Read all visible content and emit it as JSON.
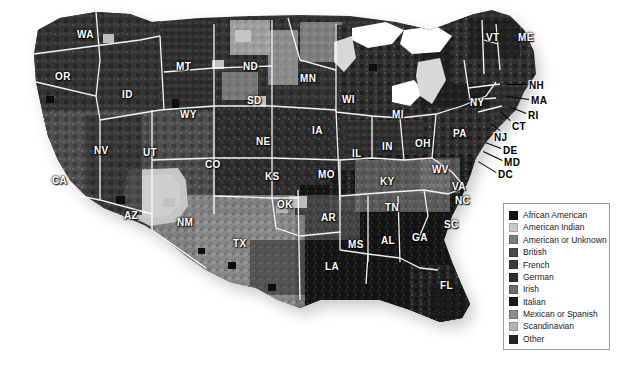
{
  "map": {
    "title": "Predominant Ancestry by County, Continental United States",
    "background_color": "#ffffff",
    "border_color": "#ffffff",
    "shadow_color": "#9a9a9a",
    "state_labels": [
      {
        "abbr": "WA",
        "x": 77,
        "y": 30,
        "outside": false
      },
      {
        "abbr": "OR",
        "x": 55,
        "y": 72,
        "outside": false
      },
      {
        "abbr": "ID",
        "x": 122,
        "y": 90,
        "outside": false
      },
      {
        "abbr": "MT",
        "x": 176,
        "y": 62,
        "outside": false
      },
      {
        "abbr": "WY",
        "x": 180,
        "y": 110,
        "outside": false
      },
      {
        "abbr": "ND",
        "x": 243,
        "y": 62,
        "outside": false
      },
      {
        "abbr": "SD",
        "x": 247,
        "y": 96,
        "outside": false
      },
      {
        "abbr": "MN",
        "x": 300,
        "y": 74,
        "outside": false
      },
      {
        "abbr": "WI",
        "x": 342,
        "y": 95,
        "outside": false
      },
      {
        "abbr": "MI",
        "x": 392,
        "y": 110,
        "outside": false
      },
      {
        "abbr": "NE",
        "x": 256,
        "y": 137,
        "outside": false
      },
      {
        "abbr": "IA",
        "x": 312,
        "y": 126,
        "outside": false
      },
      {
        "abbr": "IL",
        "x": 352,
        "y": 149,
        "outside": false
      },
      {
        "abbr": "IN",
        "x": 382,
        "y": 142,
        "outside": false
      },
      {
        "abbr": "OH",
        "x": 415,
        "y": 139,
        "outside": false
      },
      {
        "abbr": "PA",
        "x": 453,
        "y": 129,
        "outside": false
      },
      {
        "abbr": "NY",
        "x": 470,
        "y": 98,
        "outside": false
      },
      {
        "abbr": "VT",
        "x": 486,
        "y": 33,
        "outside": false
      },
      {
        "abbr": "ME",
        "x": 518,
        "y": 33,
        "outside": false
      },
      {
        "abbr": "NV",
        "x": 94,
        "y": 146,
        "outside": false
      },
      {
        "abbr": "UT",
        "x": 143,
        "y": 148,
        "outside": false
      },
      {
        "abbr": "CO",
        "x": 205,
        "y": 160,
        "outside": false
      },
      {
        "abbr": "KS",
        "x": 265,
        "y": 172,
        "outside": false
      },
      {
        "abbr": "MO",
        "x": 318,
        "y": 170,
        "outside": false
      },
      {
        "abbr": "KY",
        "x": 380,
        "y": 177,
        "outside": false
      },
      {
        "abbr": "WV",
        "x": 432,
        "y": 165,
        "outside": false
      },
      {
        "abbr": "VA",
        "x": 452,
        "y": 182,
        "outside": false
      },
      {
        "abbr": "CA",
        "x": 52,
        "y": 176,
        "outside": false
      },
      {
        "abbr": "AZ",
        "x": 124,
        "y": 211,
        "outside": false
      },
      {
        "abbr": "NM",
        "x": 177,
        "y": 218,
        "outside": false
      },
      {
        "abbr": "OK",
        "x": 277,
        "y": 200,
        "outside": false
      },
      {
        "abbr": "AR",
        "x": 321,
        "y": 213,
        "outside": false
      },
      {
        "abbr": "TN",
        "x": 385,
        "y": 203,
        "outside": false
      },
      {
        "abbr": "NC",
        "x": 455,
        "y": 196,
        "outside": false
      },
      {
        "abbr": "SC",
        "x": 444,
        "y": 220,
        "outside": false
      },
      {
        "abbr": "GA",
        "x": 412,
        "y": 233,
        "outside": false
      },
      {
        "abbr": "AL",
        "x": 381,
        "y": 236,
        "outside": false
      },
      {
        "abbr": "MS",
        "x": 348,
        "y": 240,
        "outside": false
      },
      {
        "abbr": "LA",
        "x": 325,
        "y": 262,
        "outside": false
      },
      {
        "abbr": "TX",
        "x": 233,
        "y": 239,
        "outside": false
      },
      {
        "abbr": "FL",
        "x": 440,
        "y": 281,
        "outside": false
      },
      {
        "abbr": "NH",
        "x": 529,
        "y": 81,
        "outside": true
      },
      {
        "abbr": "MA",
        "x": 531,
        "y": 96,
        "outside": true
      },
      {
        "abbr": "RI",
        "x": 528,
        "y": 111,
        "outside": true
      },
      {
        "abbr": "CT",
        "x": 512,
        "y": 122,
        "outside": true
      },
      {
        "abbr": "NJ",
        "x": 494,
        "y": 133,
        "outside": true
      },
      {
        "abbr": "DE",
        "x": 503,
        "y": 146,
        "outside": true
      },
      {
        "abbr": "MD",
        "x": 504,
        "y": 158,
        "outside": true
      },
      {
        "abbr": "DC",
        "x": 498,
        "y": 170,
        "outside": true
      }
    ],
    "leader_lines": [
      {
        "x1": 527,
        "y1": 85,
        "x2": 506,
        "y2": 85
      },
      {
        "x1": 529,
        "y1": 100,
        "x2": 506,
        "y2": 97
      },
      {
        "x1": 526,
        "y1": 114,
        "x2": 509,
        "y2": 107
      },
      {
        "x1": 510,
        "y1": 121,
        "x2": 500,
        "y2": 112
      },
      {
        "x1": 500,
        "y1": 131,
        "x2": 490,
        "y2": 124
      },
      {
        "x1": 501,
        "y1": 149,
        "x2": 485,
        "y2": 143
      },
      {
        "x1": 502,
        "y1": 161,
        "x2": 483,
        "y2": 152
      },
      {
        "x1": 496,
        "y1": 173,
        "x2": 478,
        "y2": 162
      }
    ]
  },
  "legend": {
    "title": "Ancestry categories",
    "items": [
      {
        "label": "African American",
        "color": "#131313"
      },
      {
        "label": "American Indian",
        "color": "#c9c9c9"
      },
      {
        "label": "American or Unknown",
        "color": "#7d7d7d"
      },
      {
        "label": "British",
        "color": "#4a4a4a"
      },
      {
        "label": "French",
        "color": "#3b3b3b"
      },
      {
        "label": "German",
        "color": "#2e2e2e"
      },
      {
        "label": "Irish",
        "color": "#6d6d6d"
      },
      {
        "label": "Italian",
        "color": "#1b1b1b"
      },
      {
        "label": "Mexican or Spanish",
        "color": "#8c8c8c"
      },
      {
        "label": "Scandinavian",
        "color": "#b4b4b4"
      },
      {
        "label": "Other",
        "color": "#252525"
      }
    ]
  }
}
